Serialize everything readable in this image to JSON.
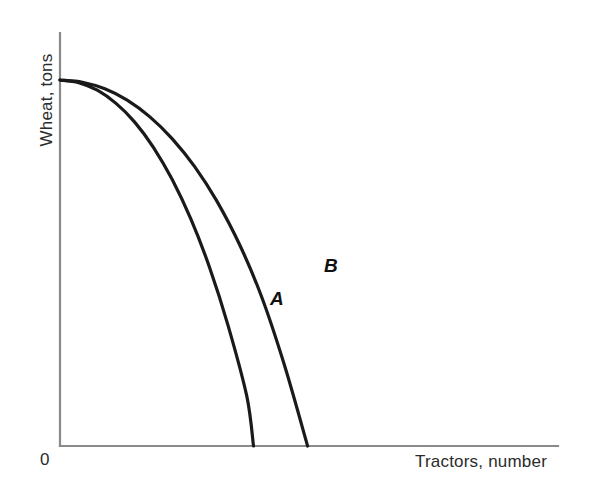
{
  "chart_data": {
    "type": "line",
    "title": "",
    "subtitle": "",
    "xlabel": "Tractors, number",
    "ylabel": "Wheat, tons",
    "origin_label": "0",
    "grid": false,
    "legend_position": "inline-curve-labels",
    "xlim": [
      0,
      100
    ],
    "ylim": [
      0,
      100
    ],
    "axis_tick_labels": {
      "x": [],
      "y": []
    },
    "annotations": [
      {
        "text": "A",
        "x": 43,
        "y": 29,
        "style": "bold-italic"
      },
      {
        "text": "B",
        "x": 53,
        "y": 38,
        "style": "bold-italic"
      }
    ],
    "series": [
      {
        "name": "A",
        "label": "A",
        "color": "#1a1a1a",
        "description": "Inner production possibility frontier",
        "x": [
          0,
          5,
          10,
          15,
          20,
          25,
          30,
          35,
          40,
          45,
          50,
          51.8
        ],
        "y": [
          100,
          99.3,
          97.2,
          93.6,
          88.5,
          81.6,
          72.9,
          62.1,
          48.9,
          32.9,
          13.6,
          0
        ]
      },
      {
        "name": "B",
        "label": "B",
        "color": "#1a1a1a",
        "description": "Outer production possibility frontier",
        "x": [
          0,
          6,
          12,
          18,
          24,
          30,
          36,
          42,
          48,
          54,
          60,
          66.3
        ],
        "y": [
          100,
          99.4,
          97.6,
          94.5,
          90.0,
          84.0,
          76.4,
          66.9,
          55.2,
          40.7,
          22.4,
          0
        ]
      }
    ]
  },
  "figure": {
    "background_color": "#ffffff",
    "axis_color": "#8a8a8a",
    "curve_color": "#1a1a1a",
    "text_color": "#2b2b2b"
  }
}
